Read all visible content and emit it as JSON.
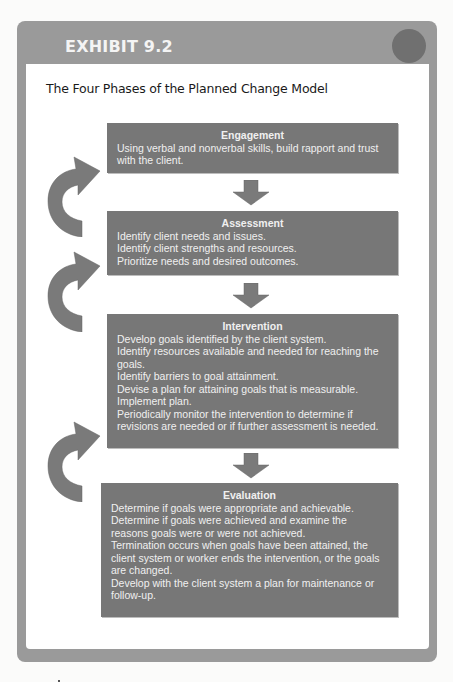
{
  "exhibit": {
    "label": "EXHIBIT 9.2",
    "title": "The Four Phases of the Planned Change Model"
  },
  "phases": [
    {
      "title": "Engagement",
      "lines": [
        "Using verbal and nonverbal skills, build rapport and trust",
        "with the client."
      ]
    },
    {
      "title": "Assessment",
      "lines": [
        "Identify client needs and issues.",
        "Identify client strengths and resources.",
        "Prioritize needs and desired outcomes."
      ]
    },
    {
      "title": "Intervention",
      "lines": [
        "Develop goals identified by the client system.",
        "Identify resources available and needed for reaching the",
        "goals.",
        "Identify barriers to goal attainment.",
        "Devise a plan for attaining goals that is measurable.",
        "Implement plan.",
        "Periodically monitor the intervention to determine if",
        "revisions are needed or if further assessment is needed."
      ]
    },
    {
      "title": "Evaluation",
      "lines": [
        "Determine if goals were appropriate and achievable.",
        "Determine if goals were achieved and examine the",
        "reasons goals were or were not achieved.",
        "Termination occurs when goals have been attained, the",
        "client system or worker ends the intervention, or the goals",
        "are changed.",
        "Develop with the client system a plan for maintenance or",
        "follow-up."
      ]
    }
  ],
  "icons": {
    "down_arrow": "down-arrow-icon",
    "cycle_arrow": "curved-return-arrow-icon"
  },
  "colors": {
    "frame": "#9a9a9a",
    "box": "#777777",
    "box_text": "#f0f0f0",
    "circle": "#707070",
    "arrow": "#7a7a7a"
  }
}
